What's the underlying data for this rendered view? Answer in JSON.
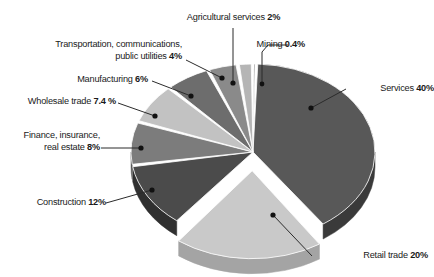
{
  "chart_data": {
    "type": "pie",
    "title": "",
    "subtitle": "",
    "xlabel": "",
    "ylabel": "",
    "legend_position": "none",
    "grid": false,
    "style": "3d-exploded-pie-grayscale",
    "units": "percent",
    "categories": [
      "Mining",
      "Services",
      "Retail trade",
      "Construction",
      "Finance, insurance, real estate",
      "Wholesale trade",
      "Manufacturing",
      "Transportation, communications, public utilities",
      "Agricultural services"
    ],
    "values": [
      0.4,
      40,
      20,
      12,
      8,
      7.4,
      6,
      4,
      2
    ],
    "slices": [
      {
        "id": "mining",
        "name": "Mining",
        "value": 0.4,
        "value_text": "0.4%",
        "label_line1": "Mining",
        "label_line2": "",
        "fill": "#4a4a4a",
        "side": "#2e2e2e",
        "exploded": false
      },
      {
        "id": "services",
        "name": "Services",
        "value": 40,
        "value_text": "40%",
        "label_line1": "Services",
        "label_line2": "",
        "fill": "#585858",
        "side": "#3a3a3a",
        "exploded": false
      },
      {
        "id": "retail-trade",
        "name": "Retail trade",
        "value": 20,
        "value_text": "20%",
        "label_line1": "Retail trade",
        "label_line2": "",
        "fill": "#c9c9c9",
        "side": "#a4a4a4",
        "exploded": true
      },
      {
        "id": "construction",
        "name": "Construction",
        "value": 12,
        "value_text": "12%",
        "label_line1": "Construction",
        "label_line2": "",
        "fill": "#4b4b4b",
        "side": "#303030",
        "exploded": false
      },
      {
        "id": "finance-insurance-real-estate",
        "name": "Finance, insurance, real estate",
        "value": 8,
        "value_text": "8%",
        "label_line1": "Finance, insurance,",
        "label_line2": "real estate",
        "fill": "#7c7c7c",
        "side": "#5a5a5a",
        "exploded": false
      },
      {
        "id": "wholesale-trade",
        "name": "Wholesale trade",
        "value": 7.4,
        "value_text": "7.4 %",
        "label_line1": "Wholesale trade",
        "label_line2": "",
        "fill": "#c2c2c2",
        "side": "#9c9c9c",
        "exploded": false
      },
      {
        "id": "manufacturing",
        "name": "Manufacturing",
        "value": 6,
        "value_text": "6%",
        "label_line1": "Manufacturing",
        "label_line2": "",
        "fill": "#6d6d6d",
        "side": "#4c4c4c",
        "exploded": false
      },
      {
        "id": "transportation-communications-public-utilities",
        "name": "Transportation, communications, public utilities",
        "value": 4,
        "value_text": "4%",
        "label_line1": "Transportation, communications,",
        "label_line2": "public utilities",
        "fill": "#8a8a8a",
        "side": "#646464",
        "exploded": false
      },
      {
        "id": "agricultural-services",
        "name": "Agricultural services",
        "value": 2,
        "value_text": "2%",
        "label_line1": "Agricultural services",
        "label_line2": "",
        "fill": "#b5b5b5",
        "side": "#8e8e8e",
        "exploded": false
      }
    ]
  },
  "labels": {
    "agricultural_services": {
      "line1": "Agricultural services",
      "pct": "2%"
    },
    "mining": {
      "line1": "Mining",
      "pct": "0.4%"
    },
    "transportation": {
      "line1": "Transportation, communications,",
      "line2": "public utilities",
      "pct": "4%"
    },
    "manufacturing": {
      "line1": "Manufacturing",
      "pct": "6%"
    },
    "wholesale_trade": {
      "line1": "Wholesale trade",
      "pct": "7.4 %"
    },
    "finance": {
      "line1": "Finance, insurance,",
      "line2": "real estate",
      "pct": "8%"
    },
    "construction": {
      "line1": "Construction",
      "pct": "12%"
    },
    "retail_trade": {
      "line1": "Retail trade",
      "pct": "20%"
    },
    "services": {
      "line1": "Services",
      "pct": "40%"
    }
  },
  "colors": {
    "background": "#ffffff",
    "text": "#1a1a1a",
    "leader_line": "#2b2b2b",
    "marker_dot": "#111111"
  }
}
